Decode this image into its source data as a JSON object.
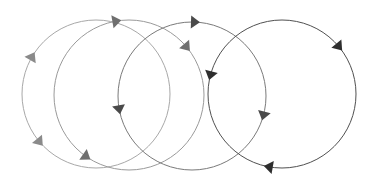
{
  "diagram": {
    "cycles": [
      {
        "id": "cycle-1",
        "shade": "#a8a8a8",
        "arrow_color": "#8a8a8a",
        "direction": "clockwise",
        "arrow_count": 2
      },
      {
        "id": "cycle-2",
        "shade": "#9a9a9a",
        "arrow_color": "#6f6f6f",
        "direction": "clockwise",
        "arrow_count": 3
      },
      {
        "id": "cycle-3",
        "shade": "#7a7a7a",
        "arrow_color": "#4a4a4a",
        "direction": "clockwise",
        "arrow_count": 3
      },
      {
        "id": "cycle-4",
        "shade": "#505050",
        "arrow_color": "#2e2e2e",
        "direction": "clockwise",
        "arrow_count": 3
      }
    ]
  }
}
